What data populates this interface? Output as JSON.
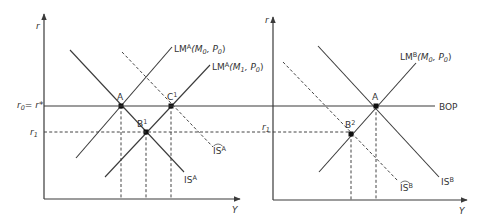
{
  "figure": {
    "left_panel": {
      "y_axis_label": "r",
      "x_axis_label": "Y",
      "r0_label": {
        "main": "r",
        "sub": "0",
        "rest": "= r*"
      },
      "r1_label": {
        "main": "r",
        "sub": "1"
      },
      "curves": {
        "lm0": {
          "base": "LM",
          "sup": "A",
          "args": "(M",
          "sub1": "0",
          "mid": ", P",
          "sub2": "0",
          "end": ")"
        },
        "lm1": {
          "base": "LM",
          "sup": "A",
          "args": "(M",
          "sub1": "1",
          "mid": ", P",
          "sub2": "0",
          "end": ")"
        },
        "is": {
          "base": "IS",
          "sup": "A"
        },
        "is_hat": {
          "base": "IS",
          "sup": "A",
          "hat": "^"
        }
      },
      "points": [
        {
          "id": "A",
          "label": "A",
          "sup": ""
        },
        {
          "id": "B1",
          "label": "B",
          "sup": "1"
        },
        {
          "id": "C1",
          "label": "C",
          "sup": "1"
        }
      ]
    },
    "right_panel": {
      "y_axis_label": "r",
      "x_axis_label": "Y",
      "r1_label": {
        "main": "r",
        "sub": "1"
      },
      "bop_label": "BOP",
      "curves": {
        "lm": {
          "base": "LM",
          "sup": "B",
          "args": "(M",
          "sub1": "0",
          "mid": ", P",
          "sub2": "0",
          "end": ")"
        },
        "is": {
          "base": "IS",
          "sup": "B"
        },
        "is_hat": {
          "base": "IS",
          "sup": "B",
          "hat": "^"
        }
      },
      "points": [
        {
          "id": "A",
          "label": "A",
          "sup": ""
        },
        {
          "id": "B2",
          "label": "B",
          "sup": "2"
        }
      ]
    }
  }
}
